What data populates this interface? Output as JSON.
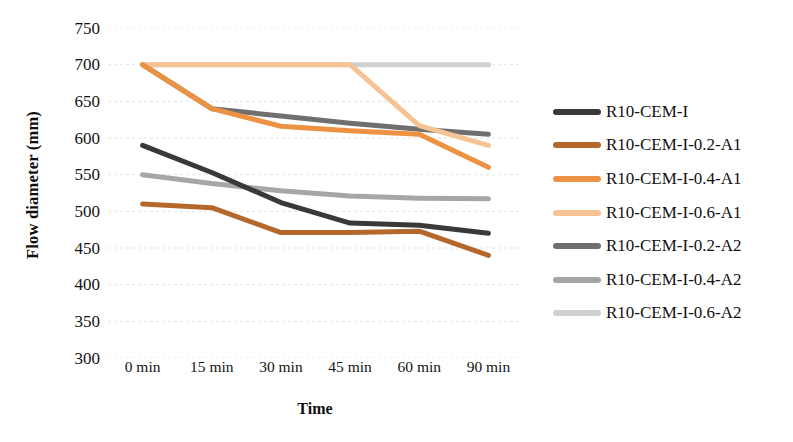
{
  "chart_data": {
    "type": "line",
    "title": "",
    "xlabel": "Time",
    "ylabel": "Flow diameter (mm)",
    "categories": [
      "0 min",
      "15 min",
      "30 min",
      "45 min",
      "60 min",
      "90 min"
    ],
    "ylim": [
      300,
      750
    ],
    "yticks": [
      300,
      350,
      400,
      450,
      500,
      550,
      600,
      650,
      700,
      750
    ],
    "ytick_step": 50,
    "grid": true,
    "legend_position": "right",
    "series": [
      {
        "name": "R10-CEM-I",
        "color": "#3b3838",
        "values": [
          590,
          553,
          512,
          484,
          481,
          470
        ]
      },
      {
        "name": "R10-CEM-I-0.2-A1",
        "color": "#b5682c",
        "values": [
          510,
          505,
          471,
          471,
          473,
          440
        ]
      },
      {
        "name": "R10-CEM-I-0.4-A1",
        "color": "#ed9242",
        "values": [
          700,
          640,
          616,
          610,
          605,
          560
        ]
      },
      {
        "name": "R10-CEM-I-0.6-A1",
        "color": "#f7c394",
        "values": [
          700,
          700,
          700,
          700,
          617,
          590
        ]
      },
      {
        "name": "R10-CEM-I-0.2-A2",
        "color": "#6f6f6f",
        "values": [
          700,
          640,
          630,
          620,
          612,
          605
        ]
      },
      {
        "name": "R10-CEM-I-0.4-A2",
        "color": "#a6a6a6",
        "values": [
          550,
          538,
          528,
          521,
          518,
          517
        ]
      },
      {
        "name": "R10-CEM-I-0.6-A2",
        "color": "#d0d0d0",
        "values": [
          700,
          700,
          700,
          700,
          700,
          700
        ]
      }
    ]
  }
}
